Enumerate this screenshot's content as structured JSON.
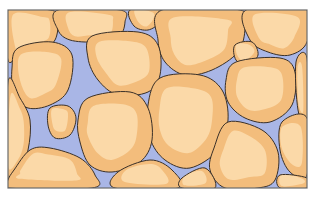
{
  "figure": {
    "colors": {
      "background": "#ffffff",
      "pore": "#a9b6e6",
      "grain_light": "#fbd9a8",
      "grain_dark": "#f3bd7c",
      "outline": "#3a3028",
      "frame": "#6b6b6b"
    },
    "frame": {
      "x": 8,
      "y": 10,
      "w": 299,
      "h": 178
    },
    "grains": [
      {
        "pts": "8,10 50,10 58,18 55,40 40,50 20,55 8,60"
      },
      {
        "pts": "58,10 120,10 125,22 118,38 95,42 70,40 58,30"
      },
      {
        "pts": "130,10 160,10 160,22 148,30 134,26"
      },
      {
        "pts": "162,10 240,10 245,28 238,52 212,70 185,75 165,62 158,40"
      },
      {
        "pts": "246,10 307,10 307,42 290,55 268,52 250,40"
      },
      {
        "pts": "235,45 252,42 258,55 248,65 236,60"
      },
      {
        "pts": "18,48 52,42 72,55 68,90 50,105 28,108 14,95 12,68"
      },
      {
        "pts": "92,36 138,32 158,45 160,75 148,92 118,95 98,80 88,58"
      },
      {
        "pts": "236,62 280,58 295,72 292,105 270,122 245,118 228,102 226,80"
      },
      {
        "pts": "296,62 307,58 307,125 298,110"
      },
      {
        "pts": "8,82 20,98 30,120 28,150 18,175 8,180"
      },
      {
        "pts": "50,108 68,106 76,118 70,135 55,138 48,125"
      },
      {
        "pts": "160,78 200,75 222,90 228,120 218,150 190,168 165,160 150,138 148,105"
      },
      {
        "pts": "88,98 130,92 148,108 152,140 140,162 112,172 90,165 80,142 78,120"
      },
      {
        "pts": "282,122 307,118 307,175 290,172 280,150"
      },
      {
        "pts": "228,122 262,130 278,152 275,180 258,188 225,188 210,170 214,148"
      },
      {
        "pts": "8,180 14,170 30,150 50,148 80,158 95,175 92,188 8,188"
      },
      {
        "pts": "118,172 150,160 172,170 178,188 115,188"
      },
      {
        "pts": "182,178 205,168 215,188 182,188"
      },
      {
        "pts": "280,175 307,178 307,188 280,188"
      }
    ]
  }
}
